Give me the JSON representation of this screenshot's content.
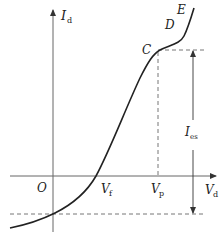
{
  "diagram": {
    "axes": {
      "y": {
        "symbol": "I",
        "subscript": "d"
      },
      "x": {
        "symbol": "V",
        "subscript": "d"
      },
      "origin": "O"
    },
    "points": {
      "C": "C",
      "D": "D",
      "E": "E"
    },
    "markers": {
      "vf": {
        "symbol": "V",
        "subscript": "f"
      },
      "vp": {
        "symbol": "V",
        "subscript": "p"
      },
      "ies": {
        "symbol": "I",
        "subscript": "es"
      }
    },
    "colors": {
      "curve": "#222222",
      "axis": "#555555",
      "dashed": "#666666"
    }
  }
}
